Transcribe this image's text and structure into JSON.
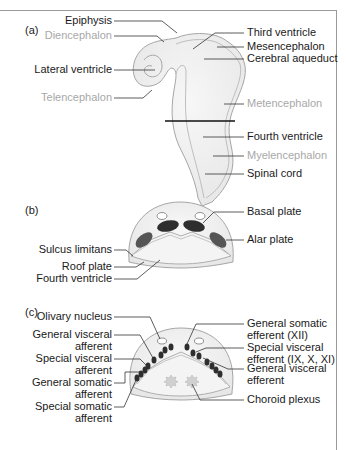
{
  "figure": {
    "panels": {
      "a": {
        "tag": "(a)",
        "labels_left": [
          {
            "text": "Epiphysis",
            "color": "dark"
          },
          {
            "text": "Diencephalon",
            "color": "grey"
          },
          {
            "text": "Lateral ventricle",
            "color": "dark"
          },
          {
            "text": "Telencephalon",
            "color": "grey"
          }
        ],
        "labels_right": [
          {
            "text": "Third ventricle",
            "color": "dark"
          },
          {
            "text": "Mesencephalon",
            "color": "dark"
          },
          {
            "text": "Cerebral aqueduct",
            "color": "dark"
          },
          {
            "text": "Metencephalon",
            "color": "grey"
          },
          {
            "text": "Fourth ventricle",
            "color": "dark"
          },
          {
            "text": "Myelencephalon",
            "color": "grey"
          },
          {
            "text": "Spinal cord",
            "color": "dark"
          }
        ]
      },
      "b": {
        "tag": "(b)",
        "labels_left": [
          "Sulcus limitans",
          "Roof plate",
          "Fourth ventricle"
        ],
        "labels_right": [
          "Basal plate",
          "Alar plate"
        ]
      },
      "c": {
        "tag": "(c)",
        "labels_left": [
          "Olivary nucleus",
          "General visceral",
          "afferent",
          "Special visceral",
          "afferent",
          "General somatic",
          "afferent",
          "Special somatic",
          "afferent"
        ],
        "labels_right": [
          "General somatic",
          "efferent (XII)",
          "Special visceral",
          "efferent (IX, X, XI)",
          "General visceral",
          "efferent",
          "Choroid plexus"
        ]
      }
    },
    "colors": {
      "tissue_fill": "#ececec",
      "tissue_outline": "#9a9a9a",
      "nucleus_dark": "#3a3a3a",
      "nucleus_mid": "#5a5a5a",
      "grey_label": "#a8a8a8"
    }
  }
}
